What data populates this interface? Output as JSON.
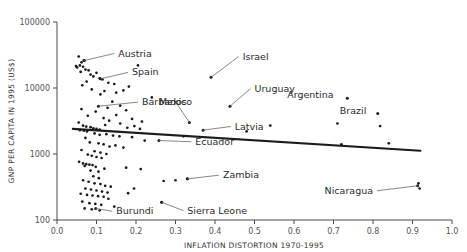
{
  "chart_data": {
    "type": "scatter",
    "title": "",
    "xlabel": "INFLATION DISTORTION 1970-1995",
    "ylabel": "GNP PER CAPITA IN 1995 (US$)",
    "xlim": [
      0.0,
      1.0
    ],
    "ylim": [
      100,
      100000
    ],
    "yscale": "log",
    "xscale": "linear",
    "grid": false,
    "legend": null,
    "xticks": [
      "0.0",
      "0.1",
      "0.2",
      "0.3",
      "0.4",
      "0.5",
      "0.6",
      "0.7",
      "0.8",
      "0.9",
      "1.0"
    ],
    "xtick_values": [
      0.0,
      0.1,
      0.2,
      0.3,
      0.4,
      0.5,
      0.6,
      0.7,
      0.8,
      0.9,
      1.0
    ],
    "yticks": [
      "100",
      "1000",
      "10000",
      "100000"
    ],
    "ytick_values": [
      100,
      1000,
      10000,
      100000
    ],
    "trendline": {
      "x": [
        0.04,
        0.92
      ],
      "y": [
        2400,
        1120
      ],
      "label": "fitted regression line"
    },
    "points": [
      {
        "x": 0.055,
        "y": 30000
      },
      {
        "x": 0.062,
        "y": 24500
      },
      {
        "x": 0.048,
        "y": 21500
      },
      {
        "x": 0.051,
        "y": 20500
      },
      {
        "x": 0.058,
        "y": 22000
      },
      {
        "x": 0.066,
        "y": 21000
      },
      {
        "x": 0.07,
        "y": 26000
      },
      {
        "x": 0.072,
        "y": 19000
      },
      {
        "x": 0.06,
        "y": 17500
      },
      {
        "x": 0.08,
        "y": 18500
      },
      {
        "x": 0.085,
        "y": 16000
      },
      {
        "x": 0.092,
        "y": 15000
      },
      {
        "x": 0.1,
        "y": 17000
      },
      {
        "x": 0.108,
        "y": 14000
      },
      {
        "x": 0.075,
        "y": 12500
      },
      {
        "x": 0.064,
        "y": 11000
      },
      {
        "x": 0.115,
        "y": 13500
      },
      {
        "x": 0.13,
        "y": 12000
      },
      {
        "x": 0.145,
        "y": 11500
      },
      {
        "x": 0.15,
        "y": 8500
      },
      {
        "x": 0.12,
        "y": 9000
      },
      {
        "x": 0.088,
        "y": 9500
      },
      {
        "x": 0.11,
        "y": 8000
      },
      {
        "x": 0.168,
        "y": 9200
      },
      {
        "x": 0.182,
        "y": 10500
      },
      {
        "x": 0.205,
        "y": 22000
      },
      {
        "x": 0.24,
        "y": 7200
      },
      {
        "x": 0.14,
        "y": 6200
      },
      {
        "x": 0.128,
        "y": 5000
      },
      {
        "x": 0.16,
        "y": 5400
      },
      {
        "x": 0.175,
        "y": 4600
      },
      {
        "x": 0.098,
        "y": 4400
      },
      {
        "x": 0.062,
        "y": 4800
      },
      {
        "x": 0.078,
        "y": 3800
      },
      {
        "x": 0.118,
        "y": 3500
      },
      {
        "x": 0.132,
        "y": 3200
      },
      {
        "x": 0.15,
        "y": 3900
      },
      {
        "x": 0.19,
        "y": 3400
      },
      {
        "x": 0.215,
        "y": 3100
      },
      {
        "x": 0.055,
        "y": 3000
      },
      {
        "x": 0.066,
        "y": 2700
      },
      {
        "x": 0.074,
        "y": 2600
      },
      {
        "x": 0.085,
        "y": 2550
      },
      {
        "x": 0.092,
        "y": 2450
      },
      {
        "x": 0.1,
        "y": 2400
      },
      {
        "x": 0.108,
        "y": 2350
      },
      {
        "x": 0.058,
        "y": 2300
      },
      {
        "x": 0.068,
        "y": 2250
      },
      {
        "x": 0.076,
        "y": 2200
      },
      {
        "x": 0.122,
        "y": 2750
      },
      {
        "x": 0.16,
        "y": 2900
      },
      {
        "x": 0.178,
        "y": 2500
      },
      {
        "x": 0.196,
        "y": 2650
      },
      {
        "x": 0.21,
        "y": 2400
      },
      {
        "x": 0.095,
        "y": 2050
      },
      {
        "x": 0.108,
        "y": 1950
      },
      {
        "x": 0.125,
        "y": 2000
      },
      {
        "x": 0.142,
        "y": 1900
      },
      {
        "x": 0.158,
        "y": 1850
      },
      {
        "x": 0.19,
        "y": 1800
      },
      {
        "x": 0.072,
        "y": 1750
      },
      {
        "x": 0.083,
        "y": 1500
      },
      {
        "x": 0.105,
        "y": 1450
      },
      {
        "x": 0.118,
        "y": 1400
      },
      {
        "x": 0.133,
        "y": 1300
      },
      {
        "x": 0.148,
        "y": 1350
      },
      {
        "x": 0.168,
        "y": 1250
      },
      {
        "x": 0.062,
        "y": 1150
      },
      {
        "x": 0.095,
        "y": 1100
      },
      {
        "x": 0.11,
        "y": 1050
      },
      {
        "x": 0.125,
        "y": 1000
      },
      {
        "x": 0.078,
        "y": 980
      },
      {
        "x": 0.088,
        "y": 940
      },
      {
        "x": 0.1,
        "y": 900
      },
      {
        "x": 0.113,
        "y": 870
      },
      {
        "x": 0.056,
        "y": 760
      },
      {
        "x": 0.066,
        "y": 720
      },
      {
        "x": 0.074,
        "y": 700
      },
      {
        "x": 0.082,
        "y": 690
      },
      {
        "x": 0.09,
        "y": 680
      },
      {
        "x": 0.07,
        "y": 660
      },
      {
        "x": 0.098,
        "y": 640
      },
      {
        "x": 0.085,
        "y": 560
      },
      {
        "x": 0.105,
        "y": 540
      },
      {
        "x": 0.12,
        "y": 600
      },
      {
        "x": 0.175,
        "y": 620
      },
      {
        "x": 0.212,
        "y": 590
      },
      {
        "x": 0.092,
        "y": 460
      },
      {
        "x": 0.106,
        "y": 430
      },
      {
        "x": 0.066,
        "y": 400
      },
      {
        "x": 0.08,
        "y": 380
      },
      {
        "x": 0.095,
        "y": 360
      },
      {
        "x": 0.11,
        "y": 350
      },
      {
        "x": 0.122,
        "y": 330
      },
      {
        "x": 0.136,
        "y": 320
      },
      {
        "x": 0.072,
        "y": 300
      },
      {
        "x": 0.086,
        "y": 290
      },
      {
        "x": 0.1,
        "y": 280
      },
      {
        "x": 0.114,
        "y": 270
      },
      {
        "x": 0.128,
        "y": 260
      },
      {
        "x": 0.06,
        "y": 250
      },
      {
        "x": 0.076,
        "y": 240
      },
      {
        "x": 0.09,
        "y": 235
      },
      {
        "x": 0.104,
        "y": 230
      },
      {
        "x": 0.118,
        "y": 225
      },
      {
        "x": 0.064,
        "y": 190
      },
      {
        "x": 0.082,
        "y": 180
      },
      {
        "x": 0.097,
        "y": 175
      },
      {
        "x": 0.112,
        "y": 170
      },
      {
        "x": 0.07,
        "y": 150
      },
      {
        "x": 0.088,
        "y": 145
      },
      {
        "x": 0.108,
        "y": 140
      },
      {
        "x": 0.13,
        "y": 210
      },
      {
        "x": 0.145,
        "y": 160
      },
      {
        "x": 0.195,
        "y": 300
      },
      {
        "x": 0.18,
        "y": 255
      },
      {
        "x": 0.222,
        "y": 1600
      },
      {
        "x": 0.32,
        "y": 1850
      },
      {
        "x": 0.3,
        "y": 400
      },
      {
        "x": 0.33,
        "y": 420
      },
      {
        "x": 0.27,
        "y": 390
      },
      {
        "x": 0.265,
        "y": 185
      },
      {
        "x": 0.48,
        "y": 2200
      },
      {
        "x": 0.54,
        "y": 2700
      },
      {
        "x": 0.72,
        "y": 1400
      },
      {
        "x": 0.71,
        "y": 2900
      },
      {
        "x": 0.84,
        "y": 1450
      },
      {
        "x": 0.818,
        "y": 2650
      },
      {
        "x": 0.915,
        "y": 360
      },
      {
        "x": 0.918,
        "y": 300
      }
    ],
    "labeled_points": [
      {
        "name": "Austria",
        "x": 0.068,
        "y": 26000,
        "label_x": 0.155,
        "label_y": 30000,
        "anchor": "start"
      },
      {
        "name": "Spain",
        "x": 0.11,
        "y": 13800,
        "label_x": 0.19,
        "label_y": 15500,
        "anchor": "start"
      },
      {
        "name": "Barbados",
        "x": 0.105,
        "y": 5300,
        "label_x": 0.215,
        "label_y": 5500,
        "anchor": "start"
      },
      {
        "name": "Mexico",
        "x": 0.335,
        "y": 3000,
        "label_x": 0.3,
        "label_y": 5600,
        "anchor": "middle"
      },
      {
        "name": "Israel",
        "x": 0.39,
        "y": 14500,
        "label_x": 0.47,
        "label_y": 27000,
        "anchor": "start"
      },
      {
        "name": "Uruguay",
        "x": 0.438,
        "y": 5300,
        "label_x": 0.5,
        "label_y": 8800,
        "anchor": "start"
      },
      {
        "name": "Argentina",
        "x": 0.735,
        "y": 7000,
        "label_x": 0.7,
        "label_y": 7000,
        "anchor": "end"
      },
      {
        "name": "Brazil",
        "x": 0.812,
        "y": 4100,
        "label_x": 0.783,
        "label_y": 4100,
        "anchor": "end"
      },
      {
        "name": "Latvia",
        "x": 0.37,
        "y": 2300,
        "label_x": 0.45,
        "label_y": 2350,
        "anchor": "start"
      },
      {
        "name": "Ecuador",
        "x": 0.258,
        "y": 1600,
        "label_x": 0.35,
        "label_y": 1380,
        "anchor": "start"
      },
      {
        "name": "Zambia",
        "x": 0.33,
        "y": 420,
        "label_x": 0.42,
        "label_y": 430,
        "anchor": "start"
      },
      {
        "name": "Burundi",
        "x": 0.098,
        "y": 150,
        "label_x": 0.15,
        "label_y": 122,
        "anchor": "start"
      },
      {
        "name": "Sierra Leone",
        "x": 0.265,
        "y": 185,
        "label_x": 0.33,
        "label_y": 125,
        "anchor": "start"
      },
      {
        "name": "Nicaragua",
        "x": 0.913,
        "y": 330,
        "label_x": 0.8,
        "label_y": 250,
        "anchor": "end"
      }
    ]
  },
  "axis": {
    "x_title": "INFLATION DISTORTION 1970-1995",
    "y_title": "GNP PER CAPITA IN 1995 (US$)"
  }
}
